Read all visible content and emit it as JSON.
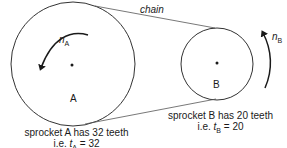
{
  "diagram": {
    "chain_label": "chain",
    "sprocket_a": {
      "letter": "A",
      "speed_symbol": "n",
      "speed_subscript": "A",
      "caption_line1": "sprocket A has 32 teeth",
      "caption_prefix": "i.e. ",
      "teeth_symbol": "t",
      "teeth_subscript": "A",
      "teeth_value": " = 32",
      "rotation": "counterclockwise"
    },
    "sprocket_b": {
      "letter": "B",
      "speed_symbol": "n",
      "speed_subscript": "B",
      "caption_line1": "sprocket B has 20 teeth",
      "caption_prefix": "i.e. ",
      "teeth_symbol": "t",
      "teeth_subscript": "B",
      "teeth_value": " = 20",
      "rotation": "counterclockwise"
    }
  }
}
